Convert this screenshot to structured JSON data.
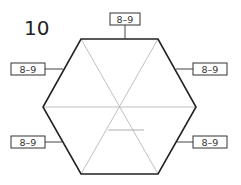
{
  "problem_number": "10",
  "labels": {
    "top": "8–9",
    "upper_left": "8–9",
    "upper_right": "8–9",
    "lower_left": "8–9",
    "lower_right": "8–9"
  },
  "colors": {
    "outline": "#222222",
    "inner": "#aaaaaa",
    "label_border": "#333333"
  }
}
